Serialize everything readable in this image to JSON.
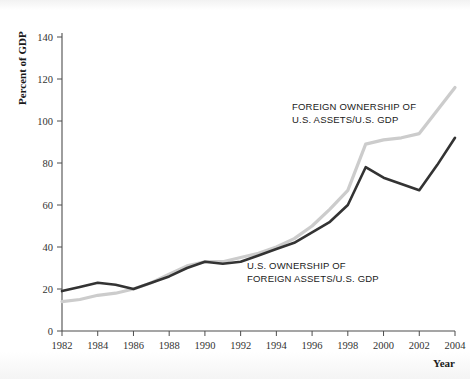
{
  "chart_data": {
    "type": "line",
    "title": "",
    "xlabel": "Year",
    "ylabel": "Percent of GDP",
    "xlim": [
      1982,
      2004
    ],
    "ylim": [
      0,
      140
    ],
    "grid": false,
    "legend_position": "inline-annotations",
    "x": [
      1982,
      1983,
      1984,
      1985,
      1986,
      1987,
      1988,
      1989,
      1990,
      1991,
      1992,
      1993,
      1994,
      1995,
      1996,
      1997,
      1998,
      1999,
      2000,
      2001,
      2002,
      2003,
      2004
    ],
    "series": [
      {
        "name": "U.S. OWNERSHIP OF FOREIGN ASSETS/U.S. GDP",
        "color": "#333333",
        "values": [
          19,
          21,
          23,
          22,
          20,
          23,
          26,
          30,
          33,
          32,
          33,
          36,
          39,
          42,
          47,
          52,
          60,
          78,
          73,
          70,
          67,
          79,
          92
        ]
      },
      {
        "name": "FOREIGN OWNERSHIP OF U.S. ASSETS/U.S. GDP",
        "color": "#cccccc",
        "values": [
          14,
          15,
          17,
          18,
          20,
          23,
          27,
          31,
          33,
          33,
          35,
          37,
          40,
          44,
          50,
          58,
          67,
          89,
          91,
          92,
          94,
          105,
          116
        ]
      }
    ],
    "ytick_labels": [
      "0",
      "20",
      "40",
      "60",
      "80",
      "100",
      "120",
      "140"
    ],
    "ytick_values": [
      0,
      20,
      40,
      60,
      80,
      100,
      120,
      140
    ],
    "xtick_labels": [
      "1982",
      "1984",
      "1986",
      "1988",
      "1990",
      "1992",
      "1994",
      "1996",
      "1998",
      "2000",
      "2002",
      "2004"
    ],
    "xtick_values": [
      1982,
      1984,
      1986,
      1988,
      1990,
      1992,
      1994,
      1996,
      1998,
      2000,
      2002,
      2004
    ],
    "annotations": [
      {
        "name": "foreign-ownership-label",
        "lines": [
          "FOREIGN OWNERSHIP OF",
          "U.S. ASSETS/U.S. GDP"
        ],
        "x": 292,
        "y": 110
      },
      {
        "name": "us-ownership-label",
        "lines": [
          "U.S. OWNERSHIP OF",
          "FOREIGN ASSETS/U.S. GDP"
        ],
        "x": 247,
        "y": 269
      }
    ]
  }
}
